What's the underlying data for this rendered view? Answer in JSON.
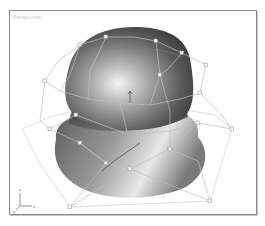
{
  "viewport": {
    "label": "Perspective",
    "axis_labels": {
      "x": "x",
      "y": "y",
      "z": "z"
    }
  },
  "colors": {
    "frame": "#8a8a8a",
    "lattice": "#c4c4c4",
    "surface_dark": "#3a3a3a",
    "surface_light": "#f2f2f2"
  }
}
